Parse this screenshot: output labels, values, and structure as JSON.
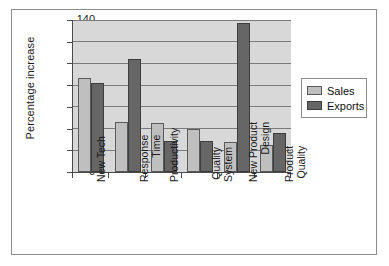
{
  "chart_data": {
    "type": "bar",
    "title": "",
    "xlabel": "",
    "ylabel": "Percentage increase",
    "ylim": [
      0,
      140
    ],
    "ytick_step": 20,
    "yticks": [
      0,
      20,
      40,
      60,
      80,
      100,
      120,
      140
    ],
    "grid": true,
    "legend_position": "right",
    "categories": [
      "New Tech",
      "Response Time",
      "Productivity",
      "Quality System",
      "New Product Design",
      "Product Quality"
    ],
    "category_lines": [
      [
        "New Tech"
      ],
      [
        "Response",
        "Time"
      ],
      [
        "Productivity"
      ],
      [
        "Quality",
        "System"
      ],
      [
        "New Product",
        "Design"
      ],
      [
        "Product",
        "Quality"
      ]
    ],
    "series": [
      {
        "name": "Sales",
        "color": "#bfbfbf",
        "values": [
          87,
          46,
          45,
          40,
          28,
          25
        ]
      },
      {
        "name": "Exports",
        "color": "#666666",
        "values": [
          82,
          104,
          29,
          29,
          137,
          36
        ]
      }
    ]
  },
  "legend": {
    "items": [
      {
        "label": "Sales"
      },
      {
        "label": "Exports"
      }
    ]
  },
  "axis": {
    "y_title": "Percentage increase",
    "y_tick_labels": [
      "140",
      "120",
      "100",
      "80",
      "60",
      "40",
      "20",
      "0"
    ]
  }
}
